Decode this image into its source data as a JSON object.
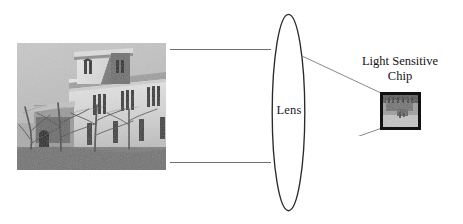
{
  "diagram": {
    "title_visible": false,
    "lens": {
      "label": "Lens",
      "shape": "ellipse",
      "stroke_color": "#2a2a2a"
    },
    "chip": {
      "label_line_1": "Light Sensitive",
      "label_line_2": "Chip",
      "border_color": "#121212",
      "content": "inverted-miniature-image"
    },
    "subject": {
      "icon_name": "building-photograph",
      "description": "grayscale photograph of a stone church building with tower and bare trees"
    },
    "rays": {
      "object_ray_color": "#6f6f6f",
      "image_ray_color": "#8a8a8a"
    },
    "background_color": "#ffffff"
  }
}
